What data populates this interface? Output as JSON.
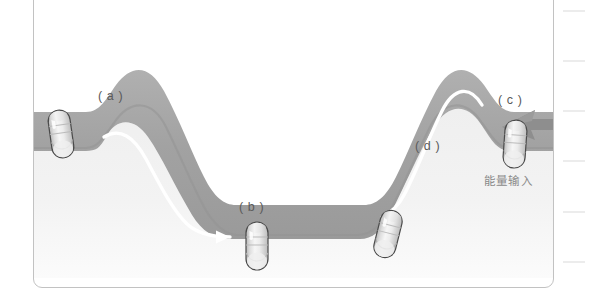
{
  "figure": {
    "type": "energy-landscape-diagram",
    "background_color": "#ffffff",
    "panel_border_color": "#c2c2c2",
    "band_color": "#a2a2a2",
    "band_shadow_color": "#8f8f8f",
    "valley_fill_color": "#f1f1f1",
    "arrow_color_flow": "#ffffff",
    "arrow_color_input": "#8c8c8c",
    "capsule_body_color": "#e8e8e8",
    "capsule_outline_color": "#4d4d4d",
    "labels": [
      {
        "id": "a",
        "text": "( a )",
        "x": 97,
        "y": 96,
        "state": "high-energy-start"
      },
      {
        "id": "b",
        "text": "( b )",
        "x": 238,
        "y": 207,
        "state": "energy-well-bottom"
      },
      {
        "id": "c",
        "text": "( c )",
        "x": 497,
        "y": 100,
        "state": "re-energised-top"
      },
      {
        "id": "d",
        "text": "( d )",
        "x": 414,
        "y": 146,
        "state": "climbing-back-up"
      }
    ],
    "annotations": [
      {
        "id": "energy-input",
        "text": "能量输入",
        "x": 483,
        "y": 179,
        "points_to": "c"
      }
    ],
    "capsules": [
      {
        "id": "a",
        "cx": 60,
        "cy": 133,
        "angle": -8,
        "width": 22,
        "height": 48
      },
      {
        "id": "b",
        "cx": 256,
        "cy": 245,
        "angle": 0,
        "width": 22,
        "height": 48
      },
      {
        "id": "c",
        "cx": 514,
        "cy": 143,
        "angle": 4,
        "width": 22,
        "height": 48
      },
      {
        "id": "d",
        "cx": 387,
        "cy": 233,
        "angle": 14,
        "width": 22,
        "height": 48
      }
    ],
    "flow_arrows": [
      {
        "id": "a-to-b",
        "direction": "right-down",
        "from": "a",
        "to": "b"
      },
      {
        "id": "d-to-c",
        "direction": "up-right",
        "from": "d",
        "to": "c"
      }
    ],
    "input_arrow": {
      "id": "energy-input-arrow",
      "direction": "left",
      "target": "c"
    }
  },
  "margin_rule": {
    "tick_color": "#ececec",
    "tick_count": 6,
    "tick_positions": [
      10,
      60,
      110,
      160,
      211,
      261
    ]
  }
}
